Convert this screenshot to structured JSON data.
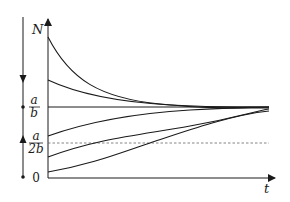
{
  "diagram": {
    "type": "logistic-growth-solution-curves",
    "axes": {
      "y_label": "N",
      "x_label": "t"
    },
    "levels": {
      "carrying_capacity": {
        "numerator": "a",
        "denominator": "b",
        "style": "solid"
      },
      "inflection": {
        "numerator": "a",
        "denominator": "2b",
        "style": "dashed"
      },
      "zero": "0"
    },
    "phase_line": {
      "arrows": [
        {
          "direction": "down",
          "region": "above a/b"
        },
        {
          "direction": "up",
          "region": "between 0 and a/b"
        }
      ],
      "equilibria": [
        "a/b",
        "0"
      ]
    },
    "curves": [
      {
        "name": "decay-from-high",
        "start": "well above a/b",
        "behavior": "decreasing to a/b"
      },
      {
        "name": "decay-from-mid",
        "start": "above a/b",
        "behavior": "decreasing to a/b"
      },
      {
        "name": "growth-above-inflection",
        "start": "between a/2b and a/b",
        "behavior": "increasing, concave down"
      },
      {
        "name": "growth-below-inflection",
        "start": "between 0 and a/2b",
        "behavior": "S-shaped, crosses a/2b"
      },
      {
        "name": "growth-near-zero",
        "start": "just above 0",
        "behavior": "S-shaped, crosses a/2b later"
      }
    ],
    "colors": {
      "ink": "#1a1a1a",
      "dashed": "#555555",
      "background": "#ffffff"
    }
  }
}
